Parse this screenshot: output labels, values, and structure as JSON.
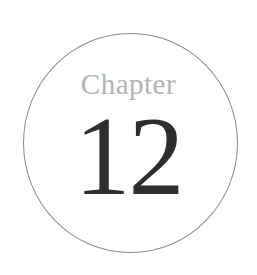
{
  "chapter_badge": {
    "label": "Chapter",
    "number": "12",
    "colors": {
      "label": "#b3b3b3",
      "number": "#2e2e2e",
      "circle_border": "#8a8a8a",
      "background": "#ffffff"
    }
  }
}
